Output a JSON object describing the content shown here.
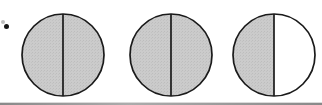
{
  "figure": {
    "background_color": "#ffffff",
    "outline_color": "#1a1a1a",
    "shade_color": "#c9c9c9",
    "divider_color": "#1a1a1a",
    "label_mark": "•",
    "caption": "",
    "circle_count": 3,
    "circles": [
      {
        "index": 1,
        "name": "circle-one",
        "shaded_halves": 2,
        "total_halves": 2,
        "fraction_label": "2/2",
        "left_half_shaded": true,
        "right_half_shaded": true,
        "center_x": 63,
        "center_y": 55,
        "radius": 42
      },
      {
        "index": 2,
        "name": "circle-two",
        "shaded_halves": 2,
        "total_halves": 2,
        "fraction_label": "2/2",
        "left_half_shaded": true,
        "right_half_shaded": true,
        "center_x": 171,
        "center_y": 55,
        "radius": 42
      },
      {
        "index": 3,
        "name": "circle-three",
        "shaded_halves": 1,
        "total_halves": 2,
        "fraction_label": "1/2",
        "left_half_shaded": true,
        "right_half_shaded": false,
        "center_x": 274,
        "center_y": 55,
        "radius": 42
      }
    ]
  },
  "chart_data": {
    "type": "pie",
    "title": "",
    "xlabel": "",
    "ylabel": "",
    "legend_position": "none",
    "grid": false,
    "categories": [
      "Circle 1",
      "Circle 2",
      "Circle 3"
    ],
    "values": [
      1.0,
      1.0,
      0.5
    ],
    "series": [
      {
        "name": "shaded fraction",
        "values": [
          1.0,
          1.0,
          0.5
        ]
      }
    ],
    "annotations": [
      "Each circle is divided into 2 equal halves by a vertical diameter",
      "Circle 1: both halves shaded",
      "Circle 2: both halves shaded",
      "Circle 3: left half shaded, right half unshaded"
    ],
    "total_shaded_halves": 5,
    "total_halves": 6,
    "shade_color": "#c9c9c9",
    "outline_color": "#1a1a1a"
  }
}
